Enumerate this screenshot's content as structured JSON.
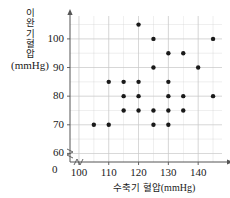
{
  "chart_data": {
    "type": "scatter",
    "title": "",
    "xlabel": "수축기 혈압(mmHg)",
    "ylabel": "이완기 혈압(mmHg)",
    "ylabel_lines": [
      "이",
      "완",
      "기",
      "혈",
      "압"
    ],
    "ylabel_unit": "(mmHg)",
    "xlabel_korean": "수축기 혈압",
    "xlabel_unit": "(mmHg)",
    "xlim": [
      97,
      148
    ],
    "ylim": [
      57,
      108
    ],
    "x_ticks": [
      100,
      110,
      120,
      130,
      140
    ],
    "y_ticks": [
      60,
      70,
      80,
      90,
      100
    ],
    "x_gridlines": [
      100,
      105,
      110,
      115,
      120,
      125,
      130,
      135,
      140,
      145
    ],
    "y_gridlines": [
      60,
      65,
      70,
      75,
      80,
      85,
      90,
      95,
      100,
      105
    ],
    "grid": true,
    "legend": "none",
    "axis_break": true,
    "origin_label": "0",
    "marker_color": "#1a1a1a",
    "grid_color": "#c9c9c9",
    "axis_color": "#555555",
    "points": [
      {
        "x": 105,
        "y": 70
      },
      {
        "x": 110,
        "y": 70
      },
      {
        "x": 110,
        "y": 85
      },
      {
        "x": 115,
        "y": 75
      },
      {
        "x": 115,
        "y": 80
      },
      {
        "x": 115,
        "y": 85
      },
      {
        "x": 120,
        "y": 75
      },
      {
        "x": 120,
        "y": 80
      },
      {
        "x": 120,
        "y": 85
      },
      {
        "x": 120,
        "y": 105
      },
      {
        "x": 125,
        "y": 70
      },
      {
        "x": 125,
        "y": 75
      },
      {
        "x": 125,
        "y": 90
      },
      {
        "x": 125,
        "y": 100
      },
      {
        "x": 130,
        "y": 70
      },
      {
        "x": 130,
        "y": 75
      },
      {
        "x": 130,
        "y": 80
      },
      {
        "x": 130,
        "y": 85
      },
      {
        "x": 130,
        "y": 95
      },
      {
        "x": 135,
        "y": 75
      },
      {
        "x": 135,
        "y": 80
      },
      {
        "x": 135,
        "y": 95
      },
      {
        "x": 140,
        "y": 90
      },
      {
        "x": 145,
        "y": 80
      },
      {
        "x": 145,
        "y": 100
      }
    ]
  }
}
